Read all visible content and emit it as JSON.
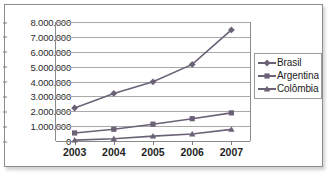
{
  "chart_data": {
    "type": "line",
    "title": "",
    "xlabel": "",
    "ylabel": "",
    "x": [
      "2003",
      "2004",
      "2005",
      "2006",
      "2007"
    ],
    "categories": [
      "2003",
      "2004",
      "2005",
      "2006",
      "2007"
    ],
    "ylim": [
      0,
      8000000
    ],
    "ytick_values": [
      0,
      1000000,
      2000000,
      3000000,
      4000000,
      5000000,
      6000000,
      7000000,
      8000000
    ],
    "ytick_labels": [
      "0",
      "1.000.000",
      "2.000.000",
      "3.000.000",
      "4.000.000",
      "5.000.000",
      "6.000.000",
      "7.000.000",
      "8.000.000"
    ],
    "grid": true,
    "legend_position": "right",
    "series": [
      {
        "name": "Brasil",
        "marker": "diamond",
        "color": "#6b6277",
        "values": [
          2220000,
          3200000,
          3980000,
          5150000,
          7470000
        ]
      },
      {
        "name": "Argentina",
        "marker": "square",
        "color": "#6b6277",
        "values": [
          540000,
          790000,
          1130000,
          1500000,
          1890000
        ]
      },
      {
        "name": "Colômbia",
        "marker": "triangle",
        "color": "#6b6277",
        "values": [
          60000,
          150000,
          330000,
          470000,
          780000
        ]
      }
    ]
  },
  "legend": {
    "items": [
      {
        "label": "Brasil"
      },
      {
        "label": "Argentina"
      },
      {
        "label": "Colômbia"
      }
    ]
  },
  "colors": {
    "frame": "#8d8d8d",
    "gridline": "#a9a9a9",
    "series": "#6b6277",
    "text": "#1f1f1f"
  }
}
